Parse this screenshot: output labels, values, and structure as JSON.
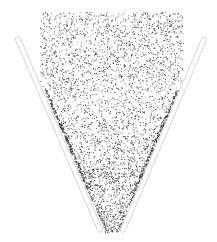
{
  "scene": {
    "width": 217,
    "height": 242,
    "background": "#ffffff",
    "particle_color": "#2a2a2a",
    "wall_stroke": "#cfcfcf",
    "particle_count": 4200,
    "particle_region": {
      "top": 12,
      "left": 40,
      "right": 183
    },
    "walls": [
      {
        "name": "left-wall",
        "x1": 17,
        "y1": 37,
        "x2": 101,
        "y2": 232,
        "width": 5
      },
      {
        "name": "right-wall",
        "x1": 205,
        "y1": 37,
        "x2": 122,
        "y2": 232,
        "width": 5
      }
    ],
    "funnel_apex": {
      "left_x": 103,
      "right_x": 120,
      "y": 232
    }
  }
}
